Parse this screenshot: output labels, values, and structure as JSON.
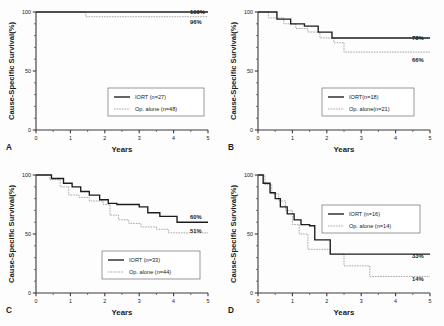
{
  "figure": {
    "axis": {
      "xlabel": "Years",
      "ylabel": "Cause-Specific Survival(%)",
      "x_ticks": [
        "0",
        "1",
        "2",
        "3",
        "4",
        "5"
      ],
      "y_ticks": [
        "100",
        "50",
        "0"
      ]
    },
    "series_names": {
      "iort": "IORT",
      "op_alone": "Op. alone"
    }
  },
  "panels": [
    {
      "letter": "A",
      "legend": {
        "iort_label": "IORT (n=27)",
        "op_label": "Op. alone (n=48)"
      },
      "endpoints": {
        "iort": "100%",
        "op": "96%"
      }
    },
    {
      "letter": "B",
      "legend": {
        "iort_label": "IORT(n=18)",
        "op_label": "Op. alone(n=21)"
      },
      "endpoints": {
        "iort": "78%",
        "op": "66%"
      }
    },
    {
      "letter": "C",
      "legend": {
        "iort_label": "IORT (n=33)",
        "op_label": "Op. alone (n=44)"
      },
      "endpoints": {
        "iort": "60%",
        "op": "51%"
      }
    },
    {
      "letter": "D",
      "legend": {
        "iort_label": "IORT (n=16)",
        "op_label": "Op. alone (n=14)"
      },
      "endpoints": {
        "iort": "33%",
        "op": "14%"
      }
    }
  ],
  "chart_data": [
    {
      "type": "line",
      "title": "A",
      "xlabel": "Years",
      "ylabel": "Cause-Specific Survival(%)",
      "xlim": [
        0,
        5
      ],
      "ylim": [
        0,
        100
      ],
      "grid": false,
      "legend_position": "inside-center-right",
      "annotations": [
        "100%",
        "96%"
      ],
      "series": [
        {
          "name": "IORT (n=27)",
          "style": "solid",
          "n": 27,
          "final_value": 100,
          "x": [
            0,
            5
          ],
          "y": [
            100,
            100
          ]
        },
        {
          "name": "Op. alone (n=48)",
          "style": "dotted",
          "n": 48,
          "final_value": 96,
          "x": [
            0,
            1.45,
            1.45,
            5
          ],
          "y": [
            100,
            100,
            96,
            96
          ]
        }
      ]
    },
    {
      "type": "line",
      "title": "B",
      "xlabel": "Years",
      "ylabel": "Cause-Specific Survival(%)",
      "xlim": [
        0,
        5
      ],
      "ylim": [
        0,
        100
      ],
      "grid": false,
      "legend_position": "inside-center-right",
      "annotations": [
        "78%",
        "66%"
      ],
      "series": [
        {
          "name": "IORT(n=18)",
          "style": "solid",
          "n": 18,
          "final_value": 78,
          "x": [
            0,
            0.55,
            0.55,
            0.95,
            0.95,
            1.35,
            1.35,
            1.75,
            1.75,
            2.15,
            2.15,
            5
          ],
          "y": [
            100,
            100,
            94,
            94,
            90,
            90,
            88,
            88,
            83,
            83,
            78,
            78
          ]
        },
        {
          "name": "Op. alone(n=21)",
          "style": "dotted",
          "n": 21,
          "final_value": 66,
          "x": [
            0,
            0.3,
            0.3,
            0.75,
            0.75,
            1.1,
            1.1,
            1.45,
            1.45,
            1.8,
            1.8,
            2.2,
            2.2,
            2.5,
            2.5,
            5
          ],
          "y": [
            100,
            100,
            95,
            95,
            90,
            90,
            86,
            86,
            83,
            83,
            78,
            78,
            74,
            74,
            66,
            66
          ]
        }
      ]
    },
    {
      "type": "line",
      "title": "C",
      "xlabel": "Years",
      "ylabel": "Cause-Specific Survival(%)",
      "xlim": [
        0,
        5
      ],
      "ylim": [
        0,
        100
      ],
      "grid": false,
      "legend_position": "inside-center-right",
      "annotations": [
        "60%",
        "51%"
      ],
      "series": [
        {
          "name": "IORT (n=33)",
          "style": "solid",
          "n": 33,
          "final_value": 60,
          "x": [
            0,
            0.45,
            0.45,
            0.8,
            0.8,
            1.05,
            1.05,
            1.3,
            1.3,
            1.55,
            1.55,
            1.85,
            1.85,
            2.1,
            2.1,
            2.35,
            2.35,
            3.0,
            3.0,
            3.25,
            3.25,
            3.6,
            3.6,
            4.1,
            4.1,
            5
          ],
          "y": [
            100,
            100,
            97,
            97,
            93,
            93,
            90,
            90,
            86,
            86,
            83,
            83,
            79,
            79,
            76,
            76,
            75,
            75,
            73,
            73,
            68,
            68,
            65,
            65,
            60,
            60
          ]
        },
        {
          "name": "Op. alone (n=44)",
          "style": "dotted",
          "n": 44,
          "final_value": 51,
          "x": [
            0,
            0.4,
            0.4,
            0.7,
            0.7,
            0.95,
            0.95,
            1.25,
            1.25,
            1.55,
            1.55,
            1.95,
            1.95,
            2.15,
            2.15,
            2.4,
            2.4,
            2.7,
            2.7,
            3.05,
            3.05,
            3.5,
            3.5,
            3.85,
            3.85,
            5
          ],
          "y": [
            100,
            100,
            96,
            96,
            90,
            90,
            83,
            83,
            81,
            81,
            78,
            78,
            75,
            75,
            66,
            66,
            62,
            62,
            59,
            59,
            56,
            56,
            54,
            54,
            51,
            51
          ]
        }
      ]
    },
    {
      "type": "line",
      "title": "D",
      "xlabel": "Years",
      "ylabel": "Cause-Specific Survival(%)",
      "xlim": [
        0,
        5
      ],
      "ylim": [
        0,
        100
      ],
      "grid": false,
      "legend_position": "inside-upper-right",
      "annotations": [
        "33%",
        "14%"
      ],
      "series": [
        {
          "name": "IORT (n=16)",
          "style": "solid",
          "n": 16,
          "final_value": 33,
          "x": [
            0,
            0.15,
            0.15,
            0.35,
            0.35,
            0.5,
            0.5,
            0.65,
            0.65,
            0.85,
            0.85,
            1.05,
            1.05,
            1.25,
            1.25,
            1.5,
            1.5,
            1.65,
            1.65,
            2.1,
            2.1,
            5
          ],
          "y": [
            100,
            100,
            93,
            93,
            85,
            85,
            80,
            80,
            73,
            73,
            67,
            67,
            62,
            62,
            58,
            58,
            57,
            57,
            45,
            45,
            33,
            33
          ]
        },
        {
          "name": "Op. alone (n=14)",
          "style": "dotted",
          "n": 14,
          "final_value": 14,
          "x": [
            0,
            0.2,
            0.2,
            0.4,
            0.4,
            0.6,
            0.6,
            0.8,
            0.8,
            1.0,
            1.0,
            1.2,
            1.2,
            1.45,
            1.45,
            2.1,
            2.1,
            2.5,
            2.5,
            3.25,
            3.25,
            5
          ],
          "y": [
            100,
            100,
            92,
            92,
            84,
            84,
            78,
            78,
            70,
            70,
            58,
            58,
            50,
            50,
            37,
            37,
            33,
            33,
            23,
            23,
            14,
            14
          ]
        }
      ]
    }
  ]
}
